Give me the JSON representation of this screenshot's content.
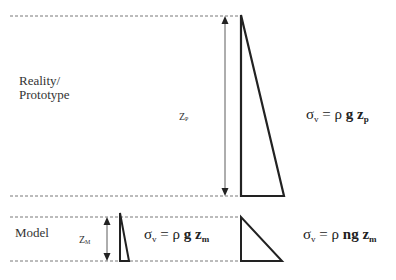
{
  "diagram": {
    "labels": {
      "prototype": "Reality/ Prototype",
      "prototype_line1": "Reality/",
      "prototype_line2": "Prototype",
      "model": "Model",
      "zp_main": "Z",
      "zp_sub": "P",
      "zm_main": "Z",
      "zm_sub": "M"
    },
    "equations": {
      "prototype": {
        "lhs": "σ",
        "lhs_sub": "v",
        "rhs_pre": " = ρ ",
        "g": "g",
        "z": "z",
        "z_sub": "p",
        "text": "σv = ρ g zp"
      },
      "model_1g": {
        "lhs": "σ",
        "lhs_sub": "v",
        "rhs_pre": " = ρ ",
        "g": "g",
        "z": "z",
        "z_sub": "m",
        "text": "σv = ρ g zm"
      },
      "model_ng": {
        "lhs": "σ",
        "lhs_sub": "v",
        "rhs_pre": " = ρ ",
        "g": "ng",
        "z": "z",
        "z_sub": "m",
        "text": "σv = ρ ng zm"
      }
    },
    "colors": {
      "line": "#222222",
      "dashed": "#555555",
      "background": "#ffffff"
    }
  }
}
